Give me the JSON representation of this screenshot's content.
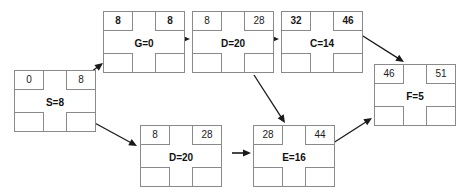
{
  "diagram": {
    "type": "activity-on-node-network-diagram",
    "node_geometry": {
      "width": 82,
      "height": 62,
      "cell_width": 30,
      "cell_height": 20
    },
    "nodes": [
      {
        "id": "S",
        "label": "S=8",
        "x": 14,
        "y": 70,
        "top_left": "0",
        "top_right": "8",
        "bottom_left": "",
        "bottom_right": "",
        "bold_top_left": false,
        "bold_top_right": false
      },
      {
        "id": "G",
        "label": "G=0",
        "x": 103,
        "y": 11,
        "top_left": "8",
        "top_right": "8",
        "bottom_left": "",
        "bottom_right": "",
        "bold_top_left": true,
        "bold_top_right": true
      },
      {
        "id": "D_top",
        "label": "D=20",
        "x": 192,
        "y": 11,
        "top_left": "8",
        "top_right": "28",
        "bottom_left": "",
        "bottom_right": "",
        "bold_top_left": false,
        "bold_top_right": false
      },
      {
        "id": "C",
        "label": "C=14",
        "x": 281,
        "y": 11,
        "top_left": "32",
        "top_right": "46",
        "bottom_left": "",
        "bottom_right": "",
        "bold_top_left": true,
        "bold_top_right": true
      },
      {
        "id": "F",
        "label": "F=5",
        "x": 374,
        "y": 64,
        "top_left": "46",
        "top_right": "51",
        "bottom_left": "",
        "bottom_right": "",
        "bold_top_left": false,
        "bold_top_right": false
      },
      {
        "id": "D_bottom",
        "label": "D=20",
        "x": 140,
        "y": 125,
        "top_left": "8",
        "top_right": "28",
        "bottom_left": "",
        "bottom_right": "",
        "bold_top_left": false,
        "bold_top_right": false
      },
      {
        "id": "E",
        "label": "E=16",
        "x": 253,
        "y": 125,
        "top_left": "28",
        "top_right": "44",
        "bottom_left": "",
        "bottom_right": "",
        "bold_top_left": false,
        "bold_top_right": false
      }
    ],
    "edges": [
      {
        "from": "S",
        "to": "G",
        "kind": "diagonal-up",
        "x1": 70,
        "y1": 88,
        "x2": 103,
        "y2": 63
      },
      {
        "from": "G",
        "to": "D_top",
        "kind": "horizontal",
        "x1": 168,
        "y1": 39,
        "x2": 190,
        "y2": 39
      },
      {
        "from": "D_top",
        "to": "C",
        "kind": "horizontal",
        "x1": 257,
        "y1": 39,
        "x2": 279,
        "y2": 39
      },
      {
        "from": "C",
        "to": "F",
        "kind": "diagonal-down",
        "x1": 355,
        "y1": 31,
        "x2": 404,
        "y2": 62
      },
      {
        "from": "S",
        "to": "D_bottom",
        "kind": "diagonal-down",
        "x1": 80,
        "y1": 115,
        "x2": 137,
        "y2": 146
      },
      {
        "from": "D_top",
        "to": "E",
        "kind": "diagonal-down",
        "x1": 254,
        "y1": 75,
        "x2": 285,
        "y2": 123
      },
      {
        "from": "D_bottom",
        "to": "E",
        "kind": "horizontal",
        "x1": 232,
        "y1": 153,
        "x2": 251,
        "y2": 153
      },
      {
        "from": "E",
        "to": "F",
        "kind": "diagonal-up",
        "x1": 330,
        "y1": 145,
        "x2": 372,
        "y2": 118
      }
    ],
    "colors": {
      "stroke": "#8a8a8a",
      "text": "#111111",
      "arrow": "#1a1a1a",
      "background": "#ffffff"
    }
  }
}
